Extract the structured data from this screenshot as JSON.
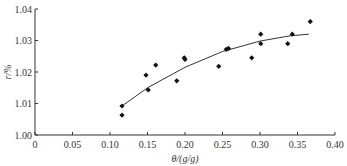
{
  "chart_data": {
    "type": "scatter",
    "title": "",
    "xlabel": "θ/(g/g)",
    "ylabel": "r/%",
    "xlim": [
      0,
      0.4
    ],
    "ylim": [
      1.0,
      1.04
    ],
    "x_ticks": [
      "0",
      "0.05",
      "0.10",
      "0.15",
      "0.20",
      "0.25",
      "0.30",
      "0.35",
      "0.40"
    ],
    "y_ticks": [
      "1.00",
      "1.01",
      "1.02",
      "1.03",
      "1.04"
    ],
    "grid": false,
    "legend": null,
    "series": [
      {
        "name": "measured",
        "marker": "diamond",
        "points": [
          {
            "x": 0.116,
            "y": 1.0092
          },
          {
            "x": 0.116,
            "y": 1.0063
          },
          {
            "x": 0.148,
            "y": 1.019
          },
          {
            "x": 0.151,
            "y": 1.0143
          },
          {
            "x": 0.161,
            "y": 1.0222
          },
          {
            "x": 0.189,
            "y": 1.0172
          },
          {
            "x": 0.199,
            "y": 1.0245
          },
          {
            "x": 0.2,
            "y": 1.024
          },
          {
            "x": 0.245,
            "y": 1.0218
          },
          {
            "x": 0.255,
            "y": 1.0272
          },
          {
            "x": 0.258,
            "y": 1.0275
          },
          {
            "x": 0.289,
            "y": 1.0245
          },
          {
            "x": 0.301,
            "y": 1.032
          },
          {
            "x": 0.301,
            "y": 1.029
          },
          {
            "x": 0.337,
            "y": 1.029
          },
          {
            "x": 0.343,
            "y": 1.032
          },
          {
            "x": 0.367,
            "y": 1.036
          }
        ]
      },
      {
        "name": "fit",
        "type": "line",
        "points": [
          {
            "x": 0.116,
            "y": 1.0092
          },
          {
            "x": 0.15,
            "y": 1.015
          },
          {
            "x": 0.2,
            "y": 1.0215
          },
          {
            "x": 0.25,
            "y": 1.0265
          },
          {
            "x": 0.3,
            "y": 1.0298
          },
          {
            "x": 0.34,
            "y": 1.0315
          },
          {
            "x": 0.365,
            "y": 1.032
          }
        ]
      }
    ]
  }
}
